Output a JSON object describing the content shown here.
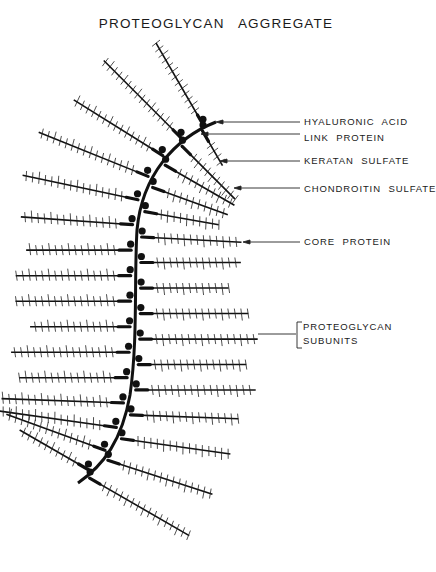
{
  "title": "PROTEOGLYCAN AGGREGATE",
  "colors": {
    "ink": "#111111",
    "background": "#ffffff"
  },
  "labels": {
    "hyaluronic_acid": "HYALURONIC ACID",
    "link_protein": "LINK PROTEIN",
    "keratan_sulfate": "KERATAN SULFATE",
    "chondroitin_sulfate": "CHONDROITIN SULFATE",
    "core_protein": "CORE PROTEIN",
    "proteoglycan_subunits_line1": "PROTEOGLYCAN",
    "proteoglycan_subunits_line2": "SUBUNITS"
  },
  "diagram": {
    "backbone": "hyaluronic acid strand (curved)",
    "subunit_count_left": 16,
    "subunit_count_right": 16,
    "components": [
      "hyaluronic acid",
      "link protein",
      "keratan sulfate",
      "chondroitin sulfate",
      "core protein"
    ]
  }
}
